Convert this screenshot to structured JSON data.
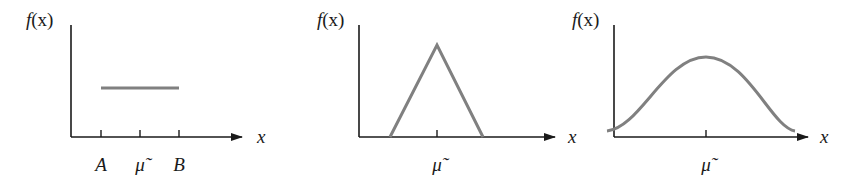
{
  "figure": {
    "colors": {
      "axis": "#1a1a1a",
      "curve": "#808080",
      "background": "#ffffff"
    },
    "panels": [
      {
        "id": "uniform",
        "y_label_f": "f",
        "y_label_paren": "(x)",
        "x_label": "x",
        "tick_labels": [
          "A",
          "μ̃",
          "B"
        ]
      },
      {
        "id": "triangular",
        "y_label_f": "f",
        "y_label_paren": "(x)",
        "x_label": "x",
        "tick_labels": [
          "μ̃"
        ]
      },
      {
        "id": "bell",
        "y_label_f": "f",
        "y_label_paren": "(x)",
        "x_label": "x",
        "tick_labels": [
          "μ̃"
        ]
      }
    ]
  }
}
